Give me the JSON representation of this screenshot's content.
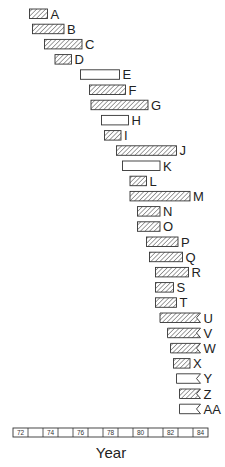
{
  "chart_data": {
    "type": "gantt",
    "title": "",
    "xlabel": "Year",
    "ylabel": "",
    "xlim": [
      72,
      85
    ],
    "x_ticks": [
      "72",
      "",
      "74",
      "",
      "76",
      "",
      "78",
      "",
      "80",
      "",
      "82",
      "",
      "84"
    ],
    "legend": null,
    "grid": false,
    "colors": {
      "stroke": "#333333",
      "hatch": "#444444",
      "open_fill": "#ffffff"
    },
    "series": [
      {
        "name": "A",
        "start": 73.1,
        "end": 74.3,
        "style": "hatched",
        "ongoing": false
      },
      {
        "name": "B",
        "start": 73.3,
        "end": 75.4,
        "style": "hatched",
        "ongoing": false
      },
      {
        "name": "C",
        "start": 74.1,
        "end": 76.6,
        "style": "hatched",
        "ongoing": false
      },
      {
        "name": "D",
        "start": 74.8,
        "end": 75.9,
        "style": "hatched",
        "ongoing": false
      },
      {
        "name": "E",
        "start": 76.5,
        "end": 79.1,
        "style": "open",
        "ongoing": false
      },
      {
        "name": "F",
        "start": 77.1,
        "end": 79.5,
        "style": "hatched",
        "ongoing": false
      },
      {
        "name": "G",
        "start": 77.2,
        "end": 81.0,
        "style": "hatched",
        "ongoing": false
      },
      {
        "name": "H",
        "start": 77.9,
        "end": 79.7,
        "style": "open",
        "ongoing": false
      },
      {
        "name": "I",
        "start": 78.1,
        "end": 79.2,
        "style": "hatched",
        "ongoing": false
      },
      {
        "name": "J",
        "start": 78.9,
        "end": 82.9,
        "style": "hatched",
        "ongoing": false
      },
      {
        "name": "K",
        "start": 79.3,
        "end": 81.8,
        "style": "open",
        "ongoing": false
      },
      {
        "name": "L",
        "start": 79.8,
        "end": 80.9,
        "style": "hatched",
        "ongoing": false
      },
      {
        "name": "M",
        "start": 79.8,
        "end": 83.8,
        "style": "hatched",
        "ongoing": false
      },
      {
        "name": "N",
        "start": 80.3,
        "end": 81.8,
        "style": "hatched",
        "ongoing": false
      },
      {
        "name": "O",
        "start": 80.3,
        "end": 81.8,
        "style": "hatched",
        "ongoing": false
      },
      {
        "name": "P",
        "start": 80.9,
        "end": 83.0,
        "style": "hatched",
        "ongoing": false
      },
      {
        "name": "Q",
        "start": 81.1,
        "end": 83.3,
        "style": "hatched",
        "ongoing": false
      },
      {
        "name": "R",
        "start": 81.5,
        "end": 83.7,
        "style": "hatched",
        "ongoing": false
      },
      {
        "name": "S",
        "start": 81.5,
        "end": 82.7,
        "style": "hatched",
        "ongoing": false
      },
      {
        "name": "T",
        "start": 81.5,
        "end": 82.9,
        "style": "hatched",
        "ongoing": false
      },
      {
        "name": "U",
        "start": 81.8,
        "end": 84.5,
        "style": "hatched",
        "ongoing": true
      },
      {
        "name": "V",
        "start": 82.3,
        "end": 84.5,
        "style": "hatched",
        "ongoing": true
      },
      {
        "name": "W",
        "start": 82.5,
        "end": 84.5,
        "style": "hatched",
        "ongoing": true
      },
      {
        "name": "X",
        "start": 82.7,
        "end": 83.8,
        "style": "hatched",
        "ongoing": false
      },
      {
        "name": "Y",
        "start": 82.9,
        "end": 84.5,
        "style": "open",
        "ongoing": true
      },
      {
        "name": "Z",
        "start": 83.1,
        "end": 84.5,
        "style": "hatched",
        "ongoing": true
      },
      {
        "name": "AA",
        "start": 83.1,
        "end": 84.5,
        "style": "open",
        "ongoing": true
      }
    ]
  }
}
